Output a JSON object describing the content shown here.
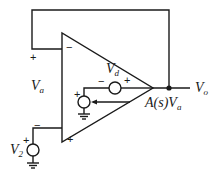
{
  "diagram": {
    "type": "op-amp equivalent circuit with feedback",
    "colors": {
      "line": "#1a1a1a",
      "background": "#ffffff"
    },
    "labels": {
      "va": {
        "base": "V",
        "sub": "a"
      },
      "vd": {
        "base": "V",
        "sub": "d"
      },
      "vo": {
        "base": "V",
        "sub": "o"
      },
      "v2": {
        "base": "V",
        "sub": "2"
      },
      "dependent_source": {
        "text": "A(s)V",
        "sub": "a"
      }
    },
    "signs": {
      "feedback_plus": "+",
      "inv_input": "−",
      "noninv_input": "+",
      "vd_minus": "−",
      "vd_plus": "+",
      "dep_plus": "+",
      "v2_minus": "−",
      "v2_plus": "+"
    }
  }
}
